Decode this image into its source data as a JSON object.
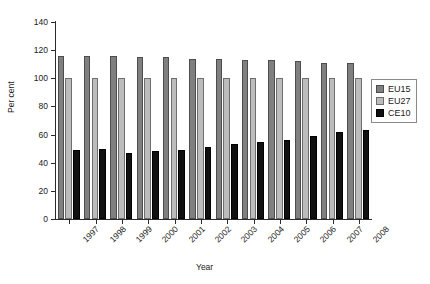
{
  "chart_data": {
    "type": "bar",
    "title": "",
    "xlabel": "Year",
    "ylabel": "Per cent",
    "ylim": [
      0,
      140
    ],
    "yticks": [
      0,
      20,
      40,
      60,
      80,
      100,
      120,
      140
    ],
    "grid": false,
    "legend_position": "right",
    "categories": [
      "1997",
      "1998",
      "1999",
      "2000",
      "2001",
      "2002",
      "2003",
      "2004",
      "2005",
      "2006",
      "2007",
      "2008"
    ],
    "series": [
      {
        "name": "EU15",
        "color": "#808080",
        "values": [
          116,
          116,
          116,
          115,
          115,
          114,
          114,
          113,
          113,
          112,
          111,
          111
        ]
      },
      {
        "name": "EU27",
        "color": "#bcbcbc",
        "values": [
          100,
          100,
          100,
          100,
          100,
          100,
          100,
          100,
          100,
          100,
          100,
          100
        ]
      },
      {
        "name": "CE10",
        "color": "#101010",
        "values": [
          49,
          50,
          47,
          48,
          49,
          51,
          53,
          55,
          56,
          59,
          62,
          63
        ]
      }
    ]
  },
  "legend": {
    "items": [
      {
        "label": "EU15",
        "key": "eu15"
      },
      {
        "label": "EU27",
        "key": "eu27"
      },
      {
        "label": "CE10",
        "key": "ce10"
      }
    ]
  }
}
